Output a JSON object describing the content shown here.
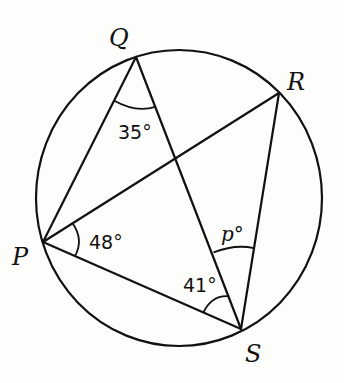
{
  "diagram": {
    "type": "circle-geometry",
    "vertices": {
      "Q": {
        "label": "Q",
        "x": 136,
        "y": 57
      },
      "R": {
        "label": "R",
        "x": 279,
        "y": 93
      },
      "P": {
        "label": "P",
        "x": 43,
        "y": 242
      },
      "S": {
        "label": "S",
        "x": 241,
        "y": 329
      }
    },
    "segments": [
      "QP",
      "QS",
      "PR",
      "PS",
      "RS"
    ],
    "angles": {
      "PQS": {
        "label": "35°",
        "value": 35
      },
      "RPS": {
        "label": "48°",
        "value": 48
      },
      "PSQ": {
        "label": "41°",
        "value": 41
      },
      "QSR": {
        "label": "p°",
        "variable": "p"
      }
    },
    "colors": {
      "stroke": "#111111",
      "background": "#fdfdfb"
    }
  }
}
